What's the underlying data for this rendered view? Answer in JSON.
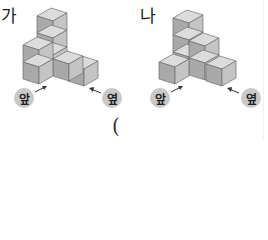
{
  "figures": [
    {
      "id": "ga",
      "label": "가",
      "front_label": "앞",
      "side_label": "옆"
    },
    {
      "id": "na",
      "label": "나",
      "front_label": "앞",
      "side_label": "옆"
    }
  ],
  "answer_blank": {
    "open_paren": "("
  },
  "colors": {
    "cube_top": "#dcdcdc",
    "cube_left": "#a9a9a9",
    "cube_right": "#c4c4c4",
    "edge": "#6f6f6f",
    "badge": "#c9c9c9"
  }
}
